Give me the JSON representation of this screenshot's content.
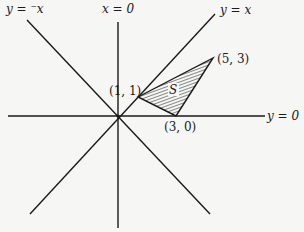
{
  "diagram": {
    "type": "geometry",
    "lines": [
      {
        "id": "y_eq_neg_x",
        "label": "y = ⁻x"
      },
      {
        "id": "x_eq_0",
        "label": "x = 0"
      },
      {
        "id": "y_eq_x",
        "label": "y = x"
      },
      {
        "id": "y_eq_0",
        "label": "y = 0"
      }
    ],
    "region": {
      "label": "S",
      "fill": "hatched",
      "vertices": [
        {
          "label": "(1, 1)",
          "x": 1,
          "y": 1
        },
        {
          "label": "(5, 3)",
          "x": 5,
          "y": 3
        },
        {
          "label": "(3, 0)",
          "x": 3,
          "y": 0
        }
      ]
    },
    "colors": {
      "background": "#f6f6f4",
      "ink": "#1a1a1a"
    }
  }
}
